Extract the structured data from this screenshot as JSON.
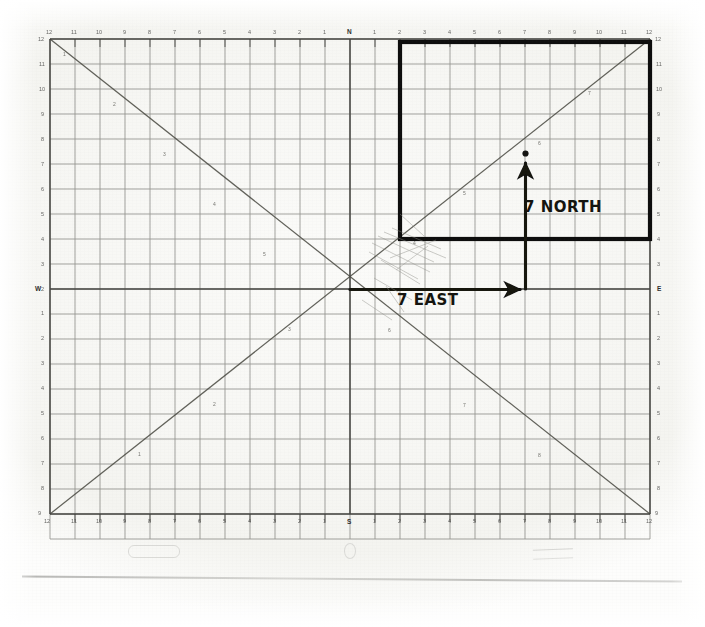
{
  "document": {
    "type": "scanned-graph-paper",
    "title": "Coordinate grid with vector annotation"
  },
  "grid": {
    "units_per_side": 24,
    "half_span": 12,
    "cell_px": 25,
    "origin_px": {
      "x": 350,
      "y": 289
    },
    "left_px": 50,
    "top_px": 39,
    "right_px": 650,
    "bottom_px": 539
  },
  "axes": {
    "top": {
      "name": "north-axis",
      "center_letter": "N",
      "ticks_left": [
        12,
        11,
        10,
        9,
        8,
        7,
        6,
        5,
        4,
        3,
        2,
        1
      ],
      "ticks_right": [
        1,
        2,
        3,
        4,
        5,
        6,
        7,
        8,
        9,
        10,
        11,
        12
      ]
    },
    "left": {
      "name": "west-axis",
      "center_letter": "W",
      "ticks_up": [
        12,
        11,
        10,
        9,
        8,
        7,
        6,
        5,
        4,
        3,
        2,
        1
      ],
      "ticks_down": [
        1,
        2,
        3,
        4,
        5,
        6,
        7,
        8,
        9,
        10,
        11,
        12
      ]
    },
    "right": {
      "name": "east-axis",
      "center_letter": "E",
      "ticks_up": [
        12,
        11,
        10,
        9,
        8,
        7,
        6,
        5,
        4,
        3,
        2,
        1
      ],
      "ticks_down": [
        1,
        2,
        3,
        4,
        5,
        6,
        7,
        8,
        9,
        10,
        11,
        12
      ]
    },
    "bottom": {
      "name": "south-axis",
      "center_letter": "S",
      "ticks_left": [
        12,
        11,
        10,
        9,
        8,
        7,
        6,
        5,
        4,
        3,
        2,
        1
      ],
      "ticks_right": [
        1,
        2,
        3,
        4,
        5,
        6,
        7,
        8,
        9,
        10,
        11,
        12
      ]
    }
  },
  "diagonals": {
    "rising": {
      "name": "rising-diagonal",
      "from": {
        "x": -12,
        "y": -12
      },
      "to": {
        "x": 12,
        "y": 12
      },
      "tick_labels": [
        1,
        2,
        3,
        4,
        5,
        6,
        7,
        8,
        9,
        10,
        11,
        12
      ]
    },
    "falling": {
      "name": "falling-diagonal",
      "from": {
        "x": -12,
        "y": 12
      },
      "to": {
        "x": 12,
        "y": -12
      },
      "tick_labels": [
        1,
        2,
        3,
        4,
        5,
        6,
        7,
        8,
        9,
        10,
        11,
        12
      ]
    }
  },
  "highlight_rectangle": {
    "name": "bold-rectangle",
    "x_from": 2,
    "x_to": 12,
    "y_from": 2,
    "y_to": 12,
    "stroke_color": "#111110",
    "stroke_width_px": 4
  },
  "annotations": {
    "east": {
      "label": "7 EAST",
      "arrow": {
        "from": {
          "x": 0,
          "y": 0
        },
        "to": {
          "x": 7,
          "y": 0
        }
      }
    },
    "north": {
      "label": "7 NORTH",
      "arrow": {
        "from": {
          "x": 7,
          "y": 0
        },
        "to": {
          "x": 7,
          "y": 5.4
        }
      }
    },
    "endpoint_dot": {
      "x": 7,
      "y": 5.4
    }
  },
  "colors": {
    "grid_line": "#6d6d66",
    "major_line": "#3a3a36",
    "diagonal_line": "#4a4a44",
    "ink": "#14140f",
    "paper": "#f7f7f4"
  }
}
